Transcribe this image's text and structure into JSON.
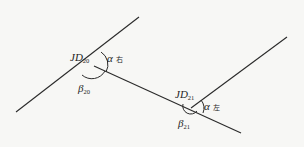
{
  "diagram": {
    "type": "route-intersection-angles",
    "colors": {
      "background": "#f7f7f5",
      "stroke": "#2a2a2a",
      "text": "#1e1e1e"
    },
    "lines": [
      {
        "id": "segment-1",
        "from": [
          16,
          112
        ],
        "to": [
          139,
          17
        ]
      },
      {
        "id": "segment-2",
        "from": [
          94,
          66
        ],
        "to": [
          241,
          133
        ]
      },
      {
        "id": "segment-3",
        "from": [
          191,
          108
        ],
        "to": [
          287,
          37
        ]
      }
    ],
    "points": [
      {
        "id": "JD20",
        "xy": [
          94,
          66
        ],
        "label": {
          "main": "JD",
          "sub": "20"
        },
        "deflection": {
          "symbol": "α",
          "side": "右"
        },
        "interior": {
          "symbol": "β",
          "sub": "20"
        }
      },
      {
        "id": "JD21",
        "xy": [
          191,
          108
        ],
        "label": {
          "main": "JD",
          "sub": "21"
        },
        "deflection": {
          "symbol": "α",
          "side": "左"
        },
        "interior": {
          "symbol": "β",
          "sub": "21"
        }
      }
    ]
  }
}
